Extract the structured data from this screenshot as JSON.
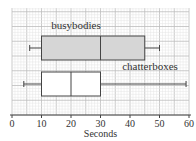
{
  "chart_data": {
    "type": "boxplot",
    "title": "",
    "xlabel": "Seconds",
    "ylabel": "",
    "xlim": [
      0,
      60
    ],
    "x_ticks": [
      0,
      10,
      20,
      30,
      40,
      50,
      60
    ],
    "x_tick_labels": [
      "0",
      "10",
      "20",
      "30",
      "40",
      "50",
      "60"
    ],
    "grid": true,
    "grid_minor_step": 1,
    "grid_major_step": 5,
    "series": [
      {
        "name": "busybodies",
        "min": 6,
        "q1": 10,
        "median": 30,
        "q3": 45,
        "max": 50,
        "fill": "#d6d6d6"
      },
      {
        "name": "chatterboxes",
        "min": 4,
        "q1": 10,
        "median": 20,
        "q3": 30,
        "max": 59,
        "fill": "#ffffff"
      }
    ]
  },
  "colors": {
    "grid_minor": "#e4e4e4",
    "grid_major": "#bdbdbd",
    "stroke": "#444444"
  }
}
